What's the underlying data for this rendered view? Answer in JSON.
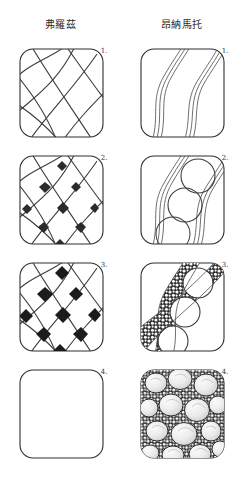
{
  "page": {
    "title_left": "弗羅茲",
    "title_right": "昂納馬托",
    "background_color": "#ffffff",
    "ink_color": "#3c3c3c",
    "stone_fill": "#e8e8e8",
    "mortar_color": "#2b2b2b"
  },
  "columns": [
    {
      "name": "florz",
      "header": "弗羅茲",
      "steps": [
        {
          "number": "1.",
          "description": "crossing curved diagonal lattice lines"
        },
        {
          "number": "2.",
          "description": "lattice with small dark diamonds at intersections"
        },
        {
          "number": "3.",
          "description": "lattice with filled-in dark diamonds"
        },
        {
          "number": "4.",
          "description": "empty tile"
        }
      ]
    },
    {
      "name": "onamato",
      "header": "昂納馬托",
      "steps": [
        {
          "number": "1.",
          "description": "two parallel wavy double-line ribbons"
        },
        {
          "number": "2.",
          "description": "ribbons with large circular stones between"
        },
        {
          "number": "3.",
          "description": "ribbon band filled with small pebble texture"
        },
        {
          "number": "4.",
          "description": "full tile of shaded stones with pebble mortar"
        }
      ]
    }
  ],
  "labels": {
    "step_numbers": [
      "1.",
      "2.",
      "3.",
      "4."
    ]
  }
}
